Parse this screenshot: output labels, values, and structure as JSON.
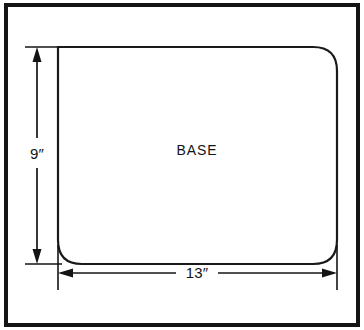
{
  "figure": {
    "type": "engineering-dimension-drawing",
    "background_color": "#ffffff",
    "line_color": "#141414"
  },
  "frame": {
    "name": "outer-border",
    "stroke_color": "#141414",
    "stroke_width": 4
  },
  "part": {
    "label": "BASE",
    "shape": "rounded-rectangle",
    "stroke_color": "#1a1a1a",
    "stroke_width": 2.2,
    "fill": "#ffffff"
  },
  "dimensions": [
    {
      "id": "height-dimension",
      "label": "9″",
      "value": 9,
      "unit": "inch",
      "orientation": "vertical",
      "placement": "left"
    },
    {
      "id": "width-dimension",
      "label": "13″",
      "value": 13,
      "unit": "inch",
      "orientation": "horizontal",
      "placement": "bottom"
    }
  ],
  "labels": {
    "height": "9″",
    "width": "13″",
    "part_name": "BASE"
  }
}
